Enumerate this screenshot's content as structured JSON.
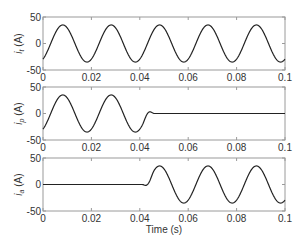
{
  "chart_data": [
    {
      "type": "line",
      "title": "",
      "xlabel": "",
      "ylabel": "i_t (A)",
      "ylabel_main": "i",
      "ylabel_sub": "t",
      "ylabel_unit": " (A)",
      "xlim": [
        0,
        0.1
      ],
      "ylim": [
        -50,
        50
      ],
      "xticks": [
        "0",
        "0.02",
        "0.04",
        "0.06",
        "0.08",
        "0.1"
      ],
      "yticks": [
        "50",
        "0",
        "-50"
      ],
      "grid": false,
      "series": [
        {
          "name": "i_t",
          "model": "sine",
          "amplitude": 35,
          "frequency_hz": 50,
          "phase_rad": -1.0,
          "active_from": 0,
          "active_to": 0.1,
          "x": [
            0,
            0.0082,
            0.0182,
            0.0282,
            0.0382,
            0.0482,
            0.0582,
            0.0682,
            0.0782,
            0.0882,
            0.0982,
            0.1
          ],
          "values": [
            -29.5,
            35,
            -35,
            35,
            -35,
            35,
            -35,
            35,
            -35,
            35,
            -35,
            -29.5
          ]
        }
      ]
    },
    {
      "type": "line",
      "title": "",
      "xlabel": "",
      "ylabel": "i_p (A)",
      "ylabel_main": "i",
      "ylabel_sub": "p",
      "ylabel_unit": " (A)",
      "xlim": [
        0,
        0.1
      ],
      "ylim": [
        -50,
        50
      ],
      "xticks": [
        "0",
        "0.02",
        "0.04",
        "0.06",
        "0.08",
        "0.1"
      ],
      "yticks": [
        "50",
        "0",
        "-50"
      ],
      "grid": false,
      "series": [
        {
          "name": "i_p",
          "model": "sine_then_zero",
          "amplitude": 35,
          "frequency_hz": 50,
          "phase_rad": -1.0,
          "transition_start": 0.041,
          "transition_end": 0.046,
          "x": [
            0,
            0.0082,
            0.0182,
            0.0282,
            0.0382,
            0.041,
            0.046,
            0.1
          ],
          "values": [
            -29.5,
            35,
            -35,
            35,
            -35,
            -28,
            0,
            0
          ]
        }
      ]
    },
    {
      "type": "line",
      "title": "",
      "xlabel": "Time (s)",
      "ylabel": "i_a (A)",
      "ylabel_main": "i",
      "ylabel_sub": "a",
      "ylabel_unit": " (A)",
      "xlim": [
        0,
        0.1
      ],
      "ylim": [
        -50,
        50
      ],
      "xticks": [
        "0",
        "0.02",
        "0.04",
        "0.06",
        "0.08",
        "0.1"
      ],
      "yticks": [
        "50",
        "0",
        "-50"
      ],
      "grid": false,
      "series": [
        {
          "name": "i_a",
          "model": "zero_then_sine",
          "amplitude": 35,
          "frequency_hz": 50,
          "phase_rad": -1.0,
          "transition_start": 0.041,
          "transition_end": 0.046,
          "x": [
            0,
            0.041,
            0.0482,
            0.0582,
            0.0682,
            0.0782,
            0.0882,
            0.0982,
            0.1
          ],
          "values": [
            0,
            0,
            35,
            -35,
            35,
            -35,
            35,
            -35,
            -29.5
          ]
        }
      ]
    }
  ],
  "layout": {
    "axes_left": 43,
    "axes_right": 285,
    "axes_tops": [
      17,
      87,
      158
    ],
    "axes_height": 53,
    "line_color": "#222222",
    "axis_color": "#9a9a9a",
    "tick_label_color": "#333333"
  }
}
